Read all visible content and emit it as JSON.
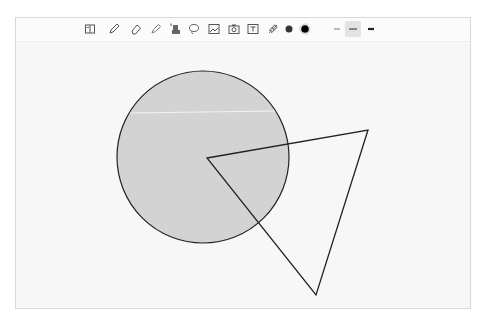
{
  "toolbar": {
    "tools": [
      {
        "name": "book-icon",
        "x": 66
      },
      {
        "name": "pencil-icon",
        "x": 90
      },
      {
        "name": "eraser-icon",
        "x": 112
      },
      {
        "name": "highlighter-icon",
        "x": 132
      },
      {
        "name": "stamp-icon",
        "x": 151
      },
      {
        "name": "lasso-icon",
        "x": 170
      },
      {
        "name": "image-icon",
        "x": 190
      },
      {
        "name": "camera-icon",
        "x": 210
      },
      {
        "name": "text-icon",
        "x": 229
      },
      {
        "name": "link-icon",
        "x": 249
      }
    ],
    "colors": [
      {
        "name": "color-dark-gray",
        "hex": "#333333",
        "x": 270
      },
      {
        "name": "color-black",
        "hex": "#000000",
        "x": 286,
        "selected": true
      }
    ],
    "stroke_widths": [
      {
        "name": "stroke-thin",
        "x": 321
      },
      {
        "name": "stroke-medium",
        "x": 337,
        "selected": true
      },
      {
        "name": "stroke-thick",
        "x": 355
      }
    ]
  },
  "canvas": {
    "circle": {
      "cx": 203,
      "cy": 157,
      "r": 86,
      "fill": "#d3d3d3",
      "stroke": "#222222"
    },
    "triangle": {
      "points": "207,158 368,130 316,295",
      "stroke": "#222222"
    }
  }
}
